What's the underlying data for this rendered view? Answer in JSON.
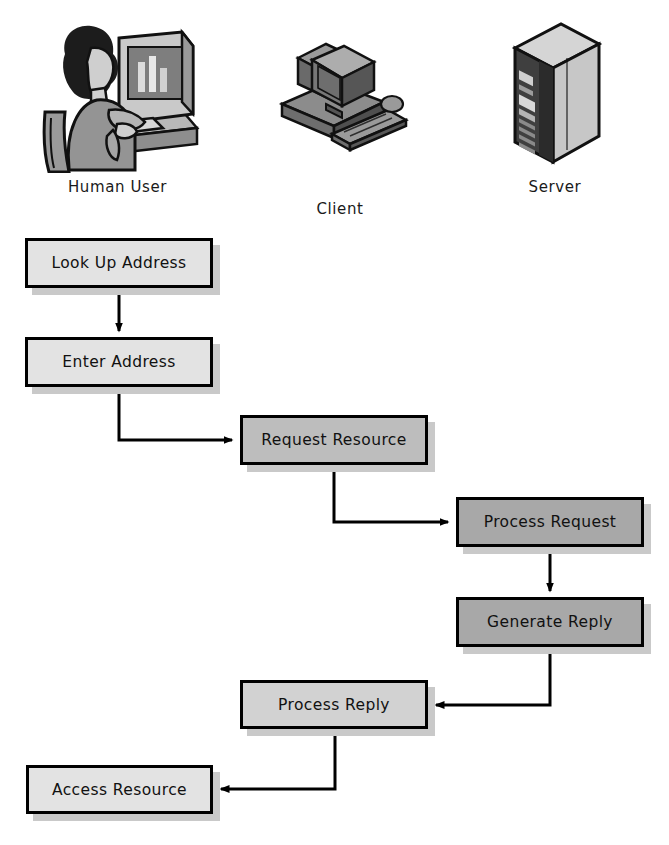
{
  "diagram": {
    "type": "flowchart",
    "title": "",
    "actors": [
      {
        "id": "human-user",
        "label": "Human User",
        "icon": "person-at-computer-icon",
        "x": 35,
        "y": 18,
        "width": 165,
        "height": 155
      },
      {
        "id": "client",
        "label": "Client",
        "icon": "desktop-computer-icon",
        "x": 270,
        "y": 40,
        "width": 140,
        "height": 115
      },
      {
        "id": "server",
        "label": "Server",
        "icon": "server-rack-icon",
        "x": 495,
        "y": 18,
        "width": 120,
        "height": 155
      }
    ],
    "nodes": [
      {
        "id": "look-up-address",
        "label": "Look Up Address",
        "x": 25,
        "y": 238,
        "width": 188,
        "height": 50,
        "fill": "#e3e3e3",
        "lane": "human-user"
      },
      {
        "id": "enter-address",
        "label": "Enter Address",
        "x": 25,
        "y": 337,
        "width": 188,
        "height": 50,
        "fill": "#e3e3e3",
        "lane": "human-user"
      },
      {
        "id": "request-resource",
        "label": "Request Resource",
        "x": 240,
        "y": 415,
        "width": 188,
        "height": 50,
        "fill": "#bdbdbd",
        "lane": "client"
      },
      {
        "id": "process-request",
        "label": "Process Request",
        "x": 456,
        "y": 497,
        "width": 188,
        "height": 50,
        "fill": "#a8a8a8",
        "lane": "server"
      },
      {
        "id": "generate-reply",
        "label": "Generate Reply",
        "x": 456,
        "y": 597,
        "width": 188,
        "height": 50,
        "fill": "#a8a8a8",
        "lane": "server"
      },
      {
        "id": "process-reply",
        "label": "Process Reply",
        "x": 240,
        "y": 680,
        "width": 188,
        "height": 49,
        "fill": "#d2d2d2",
        "lane": "client"
      },
      {
        "id": "access-resource",
        "label": "Access Resource",
        "x": 26,
        "y": 765,
        "width": 187,
        "height": 49,
        "fill": "#e3e3e3",
        "lane": "human-user"
      }
    ],
    "edges": [
      {
        "id": "edge-lookup-to-enter",
        "from": "look-up-address",
        "to": "enter-address",
        "style": "straight-down"
      },
      {
        "id": "edge-enter-to-request",
        "from": "enter-address",
        "to": "request-resource",
        "style": "elbow-down-right"
      },
      {
        "id": "edge-request-to-process",
        "from": "request-resource",
        "to": "process-request",
        "style": "elbow-down-right"
      },
      {
        "id": "edge-process-to-generate",
        "from": "process-request",
        "to": "generate-reply",
        "style": "straight-down"
      },
      {
        "id": "edge-generate-to-processreply",
        "from": "generate-reply",
        "to": "process-reply",
        "style": "elbow-down-left"
      },
      {
        "id": "edge-processreply-to-access",
        "from": "process-reply",
        "to": "access-resource",
        "style": "elbow-down-left"
      }
    ],
    "colors": {
      "stroke": "#000000",
      "shadow": "#c9c9c9",
      "background": "#ffffff",
      "text": "#111111",
      "fill_light": "#e3e3e3",
      "fill_medium": "#bdbdbd",
      "fill_dark": "#a8a8a8"
    }
  }
}
